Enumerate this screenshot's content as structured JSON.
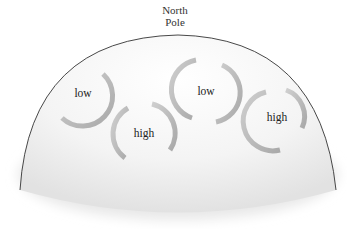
{
  "diagram": {
    "title_line1": "North",
    "title_line2": "Pole",
    "systems": [
      {
        "label": "low",
        "type": "low",
        "cx": 83,
        "cy": 93
      },
      {
        "label": "high",
        "type": "high",
        "cx": 144,
        "cy": 133
      },
      {
        "label": "low",
        "type": "low",
        "cx": 206,
        "cy": 91
      },
      {
        "label": "high",
        "type": "high",
        "cx": 277,
        "cy": 117
      }
    ],
    "colors": {
      "dome_outline": "#333333",
      "arrow": "#bdbdbd",
      "text": "#222222"
    }
  }
}
